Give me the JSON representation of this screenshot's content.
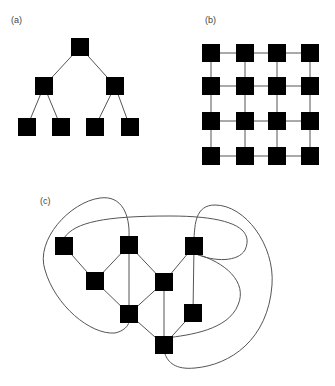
{
  "panels": [
    {
      "id": "a",
      "label": "(a)",
      "label_pos": [
        11,
        23
      ],
      "type": "tree",
      "node_size": 18,
      "nodes": [
        [
          80,
          47
        ],
        [
          44,
          86
        ],
        [
          115,
          86
        ],
        [
          27,
          127
        ],
        [
          61,
          127
        ],
        [
          95,
          127
        ],
        [
          130,
          127
        ]
      ],
      "edges": [
        [
          0,
          1
        ],
        [
          0,
          2
        ],
        [
          1,
          3
        ],
        [
          1,
          4
        ],
        [
          2,
          5
        ],
        [
          2,
          6
        ]
      ]
    },
    {
      "id": "b",
      "label": "(b)",
      "label_pos": [
        205,
        23
      ],
      "type": "grid",
      "node_size": 18,
      "cols": [
        211,
        245,
        277,
        310
      ],
      "rows": [
        53,
        86,
        121,
        156
      ]
    },
    {
      "id": "c",
      "label": "(c)",
      "label_pos": [
        40,
        204
      ],
      "type": "graph",
      "node_size": 18,
      "nodes": [
        [
          64,
          246
        ],
        [
          129,
          245
        ],
        [
          194,
          246
        ],
        [
          95,
          281
        ],
        [
          164,
          282
        ],
        [
          129,
          314
        ],
        [
          193,
          313
        ],
        [
          164,
          345
        ]
      ],
      "edges": [
        [
          0,
          3
        ],
        [
          1,
          3
        ],
        [
          1,
          5
        ],
        [
          1,
          4
        ],
        [
          2,
          4
        ],
        [
          2,
          6
        ],
        [
          3,
          5
        ],
        [
          4,
          5
        ],
        [
          4,
          7
        ],
        [
          5,
          7
        ],
        [
          6,
          7
        ]
      ],
      "curves": [
        "M129,237 C130,215 122,195 100,198 C70,202 35,240 45,270 C55,305 90,335 115,333 C124,331 128,326 129,322",
        "M64,238 C75,222 105,216 170,216 C230,216 255,228 245,250 C238,262 215,262 196,254",
        "M194,238 C195,225 195,205 215,205 C245,205 275,245 272,285 C268,340 230,365 195,368 C175,370 168,362 165,354",
        "M196,254 C225,262 248,282 238,305 C228,330 190,335 166,338"
      ]
    }
  ]
}
